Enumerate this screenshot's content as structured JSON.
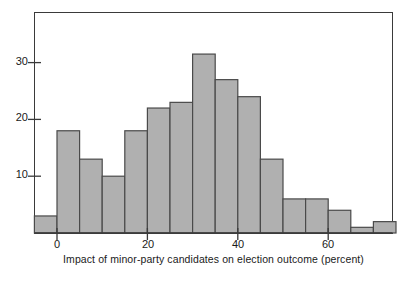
{
  "chart_data": {
    "type": "bar",
    "title": "",
    "subtitle": "",
    "xlabel": "Impact of minor-party candidates on election outcome (percent)",
    "ylabel": "",
    "xlim": [
      -7.5,
      72.5
    ],
    "ylim": [
      0,
      36
    ],
    "grid": false,
    "legend": null,
    "bin_width": 5,
    "bin_starts": [
      -5,
      0,
      5,
      10,
      15,
      20,
      25,
      30,
      35,
      40,
      45,
      50,
      55,
      60,
      65,
      70
    ],
    "categories": [
      "-5 to 0",
      "0 to 5",
      "5 to 10",
      "10 to 15",
      "15 to 20",
      "20 to 25",
      "25 to 30",
      "30 to 35",
      "35 to 40",
      "40 to 45",
      "45 to 50",
      "50 to 55",
      "55 to 60",
      "60 to 65",
      "65 to 70",
      "70 to 75"
    ],
    "values": [
      3,
      18,
      13,
      10,
      18,
      22,
      23,
      31.5,
      27,
      24,
      13,
      6,
      6,
      4,
      1,
      2
    ],
    "x_ticks": [
      0,
      20,
      40,
      60
    ],
    "x_tick_labels": [
      "0",
      "20",
      "40",
      "60"
    ],
    "y_ticks": [
      10,
      20,
      30
    ],
    "y_tick_labels": [
      "10",
      "20",
      "30"
    ],
    "bar_fill_color": "#b0b0b0",
    "bar_stroke_color": "#4a4a4a",
    "axis_color": "#3a3a3a"
  },
  "axes": {
    "x_title": "Impact of minor-party candidates on election outcome (percent)",
    "y_tick_10": "10",
    "y_tick_20": "20",
    "y_tick_30": "30",
    "x_tick_0": "0",
    "x_tick_20": "20",
    "x_tick_40": "40",
    "x_tick_60": "60"
  }
}
